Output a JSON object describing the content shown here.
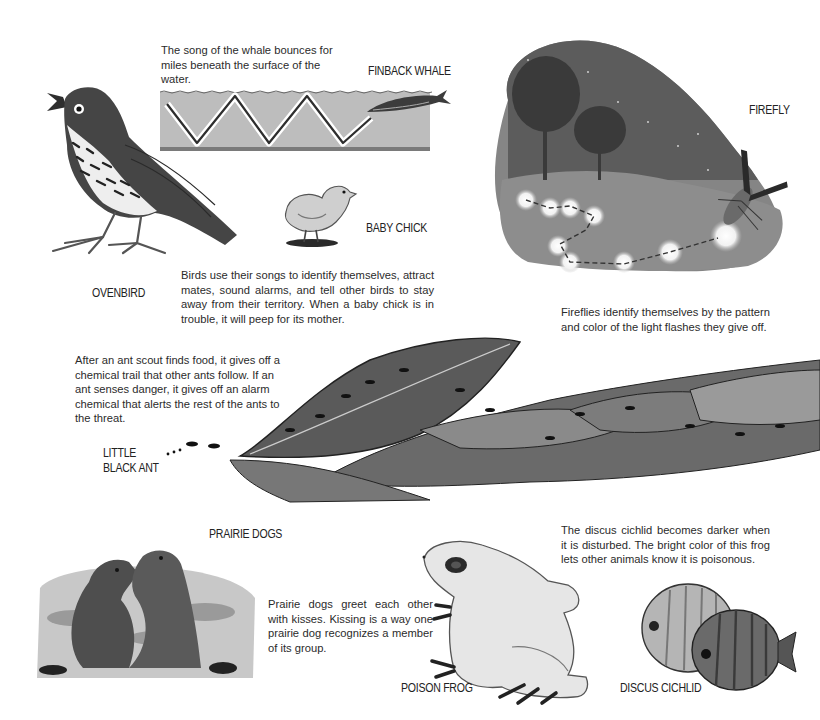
{
  "page": {
    "sections": {
      "whale": {
        "label": "FINBACK WHALE",
        "text": "The song of the whale bounces for miles beneath the surface of the water."
      },
      "ovenbird": {
        "label": "OVENBIRD"
      },
      "chick": {
        "label": "BABY CHICK"
      },
      "birds": {
        "text": "Birds use their songs to identify themselves, attract mates, sound alarms, and tell other birds to stay away from their territory. When a baby chick is in trouble, it will peep for its mother."
      },
      "firefly": {
        "label": "FIREFLY",
        "text": "Fireflies identify themselves by the pattern and color of the light flashes they give off."
      },
      "ant": {
        "label": "LITTLE\nBLACK ANT",
        "text": "After an ant scout finds food, it gives off a chemical trail that other ants follow. If an ant senses danger, it gives off an alarm chemical that alerts the rest of the ants to the threat."
      },
      "prairie_dogs": {
        "label": "PRAIRIE DOGS",
        "text": "Prairie dogs greet each other with kisses. Kissing is a way one prairie dog recognizes a member of its group."
      },
      "frog": {
        "label": "POISON FROG"
      },
      "cichlid": {
        "label": "DISCUS CICHLID",
        "text": "The discus cichlid becomes darker when it is disturbed. The bright color of this frog lets other animals know it is poisonous."
      }
    }
  },
  "colors": {
    "text": "#2b2b2b",
    "ink": "#3a3a3a",
    "wash": "#b9b9b9",
    "night": "#6c6c6c"
  }
}
